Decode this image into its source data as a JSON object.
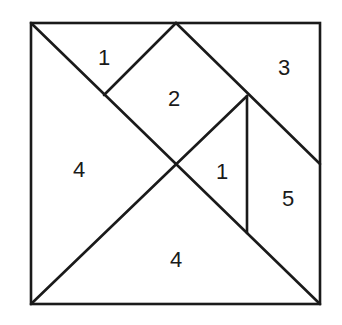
{
  "diagram": {
    "type": "tangram-square",
    "pieces": [
      {
        "id": "small-triangle-top-left",
        "label": "1"
      },
      {
        "id": "square-top-center",
        "label": "2"
      },
      {
        "id": "parallelogram-top-right",
        "label": "3"
      },
      {
        "id": "large-triangle-left",
        "label": "4"
      },
      {
        "id": "small-triangle-center-right",
        "label": "1"
      },
      {
        "id": "trapezoid-right",
        "label": "5"
      },
      {
        "id": "large-triangle-bottom",
        "label": "4"
      }
    ]
  }
}
